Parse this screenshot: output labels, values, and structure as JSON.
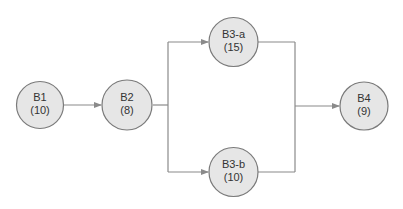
{
  "colors": {
    "node_fill": "#e6e6e6",
    "node_stroke": "#7a7a7a",
    "edge": "#8a8a8a",
    "text": "#333333"
  },
  "nodes": [
    {
      "id": "B1",
      "name": "B1",
      "duration": "(10)"
    },
    {
      "id": "B2",
      "name": "B2",
      "duration": "(8)"
    },
    {
      "id": "B3-a",
      "name": "B3-a",
      "duration": "(15)"
    },
    {
      "id": "B3-b",
      "name": "B3-b",
      "duration": "(10)"
    },
    {
      "id": "B4",
      "name": "B4",
      "duration": "(9)"
    }
  ],
  "edges": [
    {
      "from": "B1",
      "to": "B2"
    },
    {
      "from": "B2",
      "to": "B3-a"
    },
    {
      "from": "B2",
      "to": "B3-b"
    },
    {
      "from": "B3-a",
      "to": "B4"
    },
    {
      "from": "B3-b",
      "to": "B4"
    }
  ]
}
